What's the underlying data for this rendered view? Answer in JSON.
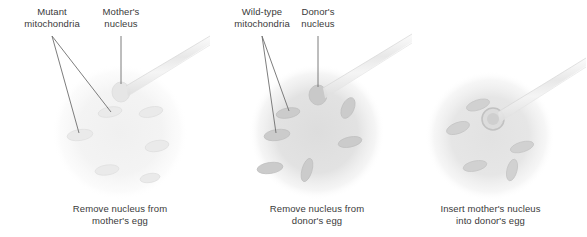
{
  "figure": {
    "background_color": "#ffffff",
    "text_color": "#3a3a3a"
  },
  "panels": [
    {
      "id": "panel-mother-egg",
      "caption_line_1": "Remove nucleus from",
      "caption_line_2": "mother's egg",
      "labels": [
        {
          "name": "mutant-mitochondria",
          "line_1": "Mutant",
          "line_2": "mitochondria"
        },
        {
          "name": "mothers-nucleus",
          "line_1": "Mother's",
          "line_2": "nucleus"
        }
      ],
      "cell": {
        "name": "mothers-egg",
        "fill": "#f2f2f2",
        "mitochondria_count": 6,
        "mitochondria_fill": "#e6e6e6",
        "nucleus_fill": "#e4e4e4"
      },
      "pipette": {
        "name": "extraction-pipette",
        "fill": "#ededed"
      }
    },
    {
      "id": "panel-donor-egg",
      "caption_line_1": "Remove nucleus from",
      "caption_line_2": "donor's egg",
      "labels": [
        {
          "name": "wild-type-mitochondria",
          "line_1": "Wild-type",
          "line_2": "mitochondria"
        },
        {
          "name": "donors-nucleus",
          "line_1": "Donor's",
          "line_2": "nucleus"
        }
      ],
      "cell": {
        "name": "donors-egg",
        "fill": "#e0e0e0",
        "mitochondria_count": 6,
        "mitochondria_fill": "#c9c9c9",
        "nucleus_fill": "#c6c6c6"
      },
      "pipette": {
        "name": "extraction-pipette",
        "fill": "#ededed"
      }
    },
    {
      "id": "panel-insert-nucleus",
      "caption_line_1": "Insert mother's nucleus",
      "caption_line_2": "into donor's egg",
      "labels": [],
      "cell": {
        "name": "reconstructed-egg",
        "fill": "#e4e4e4",
        "mitochondria_count": 5,
        "mitochondria_fill": "#cfcfcf",
        "nucleus_fill": "#d8d8d8"
      },
      "pipette": {
        "name": "injection-pipette",
        "fill": "#ededed"
      }
    }
  ]
}
